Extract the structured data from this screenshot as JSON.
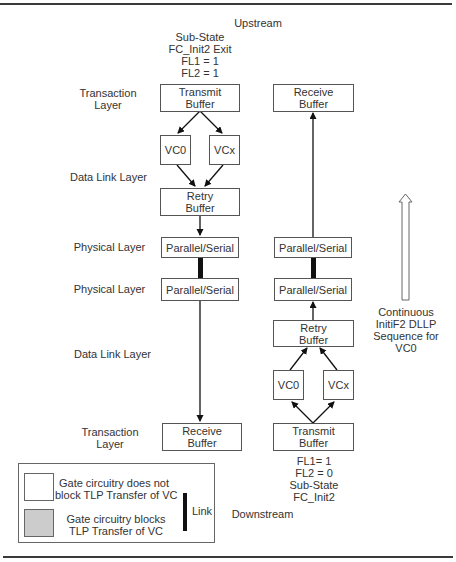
{
  "header": {
    "upstream_label": "Upstream",
    "upstream_state": [
      "Sub-State",
      "FC_Init2 Exit",
      "FL1 = 1",
      "FL2 = 1"
    ]
  },
  "layer_labels": {
    "top_transaction": [
      "Transaction",
      "Layer"
    ],
    "top_data_link": "Data Link Layer",
    "physical_1": "Physical Layer",
    "physical_2": "Physical Layer",
    "bottom_data_link": "Data Link Layer",
    "bottom_transaction": [
      "Transaction",
      "Layer"
    ]
  },
  "left_stack": {
    "transmit_buffer": [
      "Transmit",
      "Buffer"
    ],
    "vc0": "VC0",
    "vcx": "VCx",
    "retry_buffer": [
      "Retry",
      "Buffer"
    ],
    "parallel_serial_top": "Parallel/Serial",
    "parallel_serial_bottom": "Parallel/Serial",
    "receive_buffer": [
      "Receive",
      "Buffer"
    ]
  },
  "right_stack": {
    "receive_buffer": [
      "Receive",
      "Buffer"
    ],
    "parallel_serial_top": "Parallel/Serial",
    "parallel_serial_bottom": "Parallel/Serial",
    "retry_buffer": [
      "Retry",
      "Buffer"
    ],
    "vc0": "VC0",
    "vcx": "VCx",
    "transmit_buffer": [
      "Transmit",
      "Buffer"
    ]
  },
  "downstream": {
    "state": [
      "FL1=  1",
      "FL2 = 0",
      "Sub-State",
      "FC_Init2"
    ],
    "label": "Downstream"
  },
  "annotation": {
    "dllp_sequence": [
      "Continuous",
      "InitiF2 DLLP",
      "Sequence for",
      "VC0"
    ]
  },
  "legend": {
    "open_gate": [
      "Gate circuitry does not",
      "block TLP Transfer of VC"
    ],
    "blocked_gate": [
      "Gate circuitry blocks",
      "TLP Transfer of VC"
    ],
    "link": "Link",
    "colors": {
      "open": "#ffffff",
      "blocked": "#cccccc",
      "link": "#111111"
    }
  }
}
